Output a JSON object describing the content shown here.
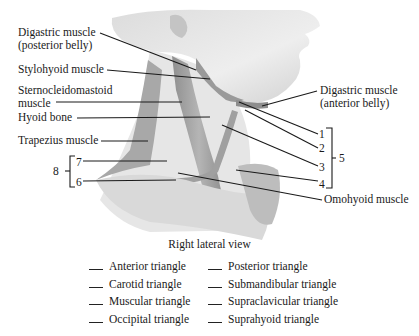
{
  "figure": {
    "view_caption": "Right lateral view",
    "left_labels": {
      "digastric_posterior_line1": "Digastric muscle",
      "digastric_posterior_line2": "(posterior belly)",
      "stylohyoid": "Stylohyoid muscle",
      "sternocleidomastoid_line1": "Sternocleidomastoid",
      "sternocleidomastoid_line2": "muscle",
      "hyoid": "Hyoid bone",
      "trapezius": "Trapezius muscle"
    },
    "right_labels": {
      "digastric_anterior_line1": "Digastric muscle",
      "digastric_anterior_line2": "(anterior belly)",
      "omohyoid": "Omohyoid muscle"
    },
    "numbers": {
      "n1": "1",
      "n2": "2",
      "n3": "3",
      "n4": "4",
      "n5": "5",
      "n6": "6",
      "n7": "7",
      "n8": "8"
    },
    "key": {
      "left_column": [
        "Anterior triangle",
        "Carotid triangle",
        "Muscular triangle",
        "Occipital triangle"
      ],
      "right_column": [
        "Posterior triangle",
        "Submandibular triangle",
        "Supraclavicular triangle",
        "Suprahyoid triangle"
      ]
    }
  }
}
